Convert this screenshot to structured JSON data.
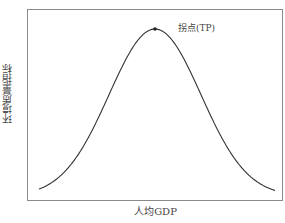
{
  "chart_data": {
    "type": "line",
    "title": "",
    "xlabel": "人均GDP",
    "ylabel": "环境质量指标",
    "grid": false,
    "legend": null,
    "x_ticks": [],
    "y_ticks": [],
    "series": [
      {
        "name": "环境库兹涅茨曲线 (inverted U)",
        "shape": "bell / inverted-U",
        "x": [
          0.0,
          0.1,
          0.2,
          0.3,
          0.4,
          0.5,
          0.6,
          0.7,
          0.8,
          0.9,
          1.0
        ],
        "values": [
          0.02,
          0.12,
          0.35,
          0.66,
          0.92,
          1.0,
          0.92,
          0.66,
          0.35,
          0.12,
          0.02
        ]
      }
    ],
    "annotations": [
      {
        "text": "拐点(TP)",
        "x": 0.5,
        "y": 1.0,
        "marker": "dot"
      }
    ],
    "colors": {
      "curve": "#333333",
      "frame": "#888888",
      "text": "#444444"
    }
  },
  "labels": {
    "ylabel": "环境质量指标",
    "xlabel": "人均GDP",
    "turning_point": "拐点(TP)"
  }
}
